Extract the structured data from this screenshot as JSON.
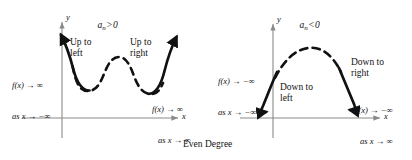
{
  "figure": {
    "caption": "Even Degree",
    "background_color": "#ffffff",
    "axis_color": "#8a8a8a",
    "curve_color": "#111111",
    "panels": [
      {
        "id": "positive-leading-coefficient",
        "condition": {
          "coefficient": "a",
          "subscript": "n",
          "operator": ">",
          "value": "0"
        },
        "axis_x_label": "x",
        "axis_y_label": "y",
        "end_behavior_left_label": "Up to\nleft",
        "end_behavior_right_label": "Up to\nright",
        "limit_left": "f(x) → ∞\nas x → −∞",
        "limit_left_line1": "f(x) → ∞",
        "limit_left_line2": "as x → −∞",
        "limit_right_line1": "f(x) → ∞",
        "limit_right_line2": "as x → ∞",
        "curve_shape": "w-shaped quartic opening upward"
      },
      {
        "id": "negative-leading-coefficient",
        "condition": {
          "coefficient": "a",
          "subscript": "n",
          "operator": "<",
          "value": "0"
        },
        "axis_x_label": "x",
        "axis_y_label": "y",
        "end_behavior_left_label": "Down to\nleft",
        "end_behavior_right_label": "Down to\nright",
        "limit_left_line1": "f(x) → −∞",
        "limit_left_line2": "as x → −∞",
        "limit_right_line1": "f(x) → −∞",
        "limit_right_line2": "as x → ∞",
        "curve_shape": "arch opening downward"
      }
    ]
  }
}
